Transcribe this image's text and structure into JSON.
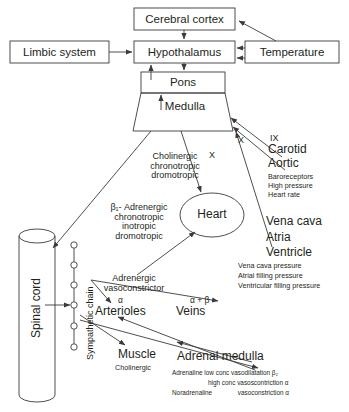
{
  "diagram": {
    "stroke_color": "#3b3b3b",
    "text_color": "#231f20",
    "background": "#ffffff"
  },
  "boxes": {
    "cerebral_cortex": "Cerebral cortex",
    "limbic_system": "Limbic system",
    "hypothalamus": "Hypothalamus",
    "temperature": "Temperature",
    "pons": "Pons",
    "medulla": "Medulla"
  },
  "nodes": {
    "heart": "Heart",
    "spinal_cord": "Spinal cord",
    "sympathetic_chain": "Sympathetic chain",
    "arterioles": "Arterioles",
    "veins": "Veins",
    "muscle": "Muscle",
    "adrenal_medulla": "Adrenal medulla"
  },
  "nerves": {
    "vagus_medulla": "X",
    "glossopharyngeal": "IX",
    "vagus_heart": "X"
  },
  "annotations": {
    "cholinergic": [
      "Cholinergic",
      "chronotropic",
      "dromotropic"
    ],
    "beta1_adrenergic": [
      "β₁- Adrenergic",
      "chronotropic",
      "inotropic",
      "dromotropic"
    ],
    "adrenergic_vasoconstrictor": [
      "Adrenergic",
      "vasoconstrictor"
    ],
    "arterioles_receptor": "α",
    "veins_receptor": "α + β",
    "muscle_transmitter": "Cholinergic"
  },
  "receptor_groups": {
    "baroreceptor_sites": [
      "Carotid",
      "Aortic"
    ],
    "baroreceptor_detail": [
      "Baroreceptors",
      "High pressure",
      "Heart rate"
    ],
    "volume_sites": [
      "Vena cava",
      "Atria",
      "Ventricle"
    ],
    "volume_detail": [
      "Vena cava pressure",
      "Atrial filling pressure",
      "Ventricular filling pressure"
    ]
  },
  "adrenal_detail": {
    "line1_drug": "Adrenaline",
    "line1_effect": "low conc vasodilatation",
    "line1_receptor": "β₂",
    "line2_effect": "high conc vasoscontriction",
    "line2_receptor": "α",
    "line3_drug": "Noradrenaline",
    "line3_effect": "vasoconstriction",
    "line3_receptor": "α"
  }
}
